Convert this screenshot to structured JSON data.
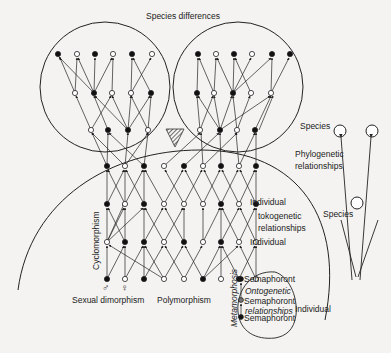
{
  "labels": {
    "species_differences": "Species differences",
    "species_top": "Species",
    "phylogenetic_1": "Phylogenetic",
    "phylogenetic_2": "relationships",
    "species_bottom": "Species",
    "individual_1": "Individual",
    "tokogenetic_1": "tokogenetic",
    "tokogenetic_2": "relationships",
    "individual_2": "Individual",
    "individual_3": "Individual",
    "cyclomorphism": "Cyclomorphism",
    "sexual_dimorphism": "Sexual dimorphism",
    "polymorphism": "Polymorphism",
    "metamorphosis": "Metamorphosis",
    "semaphoront_1": "Semaphoront",
    "ontogenetic": "Ontogenetic",
    "semaphoront_2": "Semaphoront",
    "relationships_onto": "relationships",
    "semaphoront_3": "Semaphoront",
    "male_symbol": "♂",
    "female_symbol": "♀"
  },
  "colors": {
    "background": "#f4f3f1",
    "stroke": "#222222",
    "node_filled": "#111111",
    "node_open": "#ffffff"
  }
}
